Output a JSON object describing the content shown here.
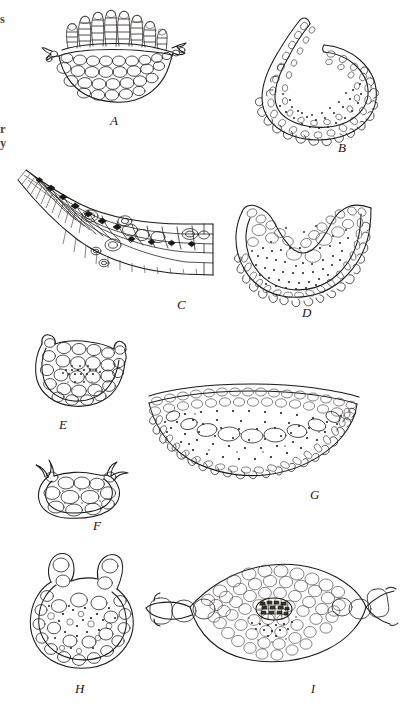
{
  "plate": {
    "caption_letters": [
      "A",
      "B",
      "C",
      "D",
      "E",
      "F",
      "G",
      "H",
      "I"
    ],
    "background_color": "#fefefe",
    "ink_color": "#1c1a18"
  },
  "margin_fragments": [
    {
      "text": "s",
      "top": 18
    },
    {
      "text": "r",
      "top": 128
    },
    {
      "text": "y",
      "top": 142
    }
  ],
  "figures": [
    {
      "id": "A",
      "label": "A",
      "label_x": 110,
      "label_y": 113,
      "description": "cross-section with erect palisade filaments fanning from a cupped multicellular base"
    },
    {
      "id": "B",
      "label": "B",
      "label_x": 338,
      "label_y": 140,
      "description": "incurled spiral cross-section with lobed margin and stippled interior"
    },
    {
      "id": "C",
      "label": "C",
      "label_x": 177,
      "label_y": 297,
      "description": "tapering marginal cross-section with rows of darkened thick-walled cells"
    },
    {
      "id": "D",
      "label": "D",
      "label_x": 302,
      "label_y": 305,
      "description": "V-shaped cross-section with marginal papillae and dense stippled interior"
    },
    {
      "id": "E",
      "label": "E",
      "label_x": 59,
      "label_y": 417,
      "description": "small cupped cross-section with large peripheral cells and stippled core"
    },
    {
      "id": "F",
      "label": "F",
      "label_x": 93,
      "label_y": 518,
      "description": "small rounded cell cluster with two horn-like projections"
    },
    {
      "id": "G",
      "label": "G",
      "label_x": 310,
      "label_y": 487,
      "description": "broad shallow crescent cross-section with crenulate lower margin and heavy stippling"
    },
    {
      "id": "H",
      "label": "H",
      "label_x": 75,
      "label_y": 681,
      "description": "rounded cross-section with two raised shoulder lobes and scattered cells"
    },
    {
      "id": "I",
      "label": "I",
      "label_x": 311,
      "label_y": 682,
      "description": "broad lenticular cross-section with lateral wings and a dark cross-hatched central strand"
    }
  ]
}
